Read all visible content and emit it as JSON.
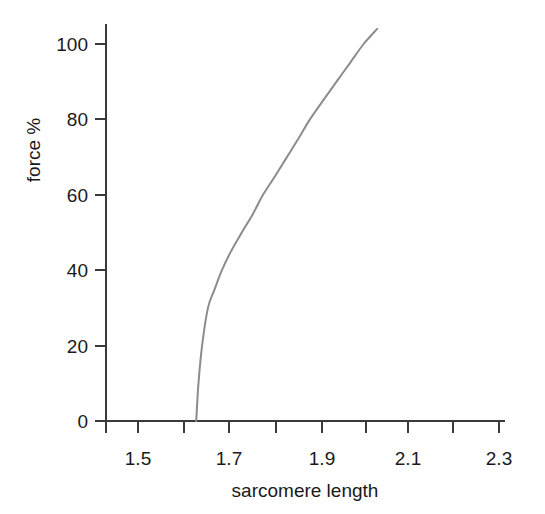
{
  "chart_data": {
    "type": "line",
    "title": "",
    "xlabel": "sarcomere length",
    "ylabel": "force %",
    "xlim": [
      1.42,
      2.3
    ],
    "ylim": [
      0,
      108
    ],
    "grid": false,
    "legend": null,
    "x_ticks": [
      {
        "value": 1.5,
        "label": "1.5",
        "major": true
      },
      {
        "value": 1.6,
        "label": "",
        "major": false
      },
      {
        "value": 1.7,
        "label": "1.7",
        "major": true
      },
      {
        "value": 1.8,
        "label": "",
        "major": false
      },
      {
        "value": 1.9,
        "label": "1.9",
        "major": true
      },
      {
        "value": 2.0,
        "label": "",
        "major": false
      },
      {
        "value": 2.1,
        "label": "2.1",
        "major": true
      },
      {
        "value": 2.2,
        "label": "",
        "major": false
      },
      {
        "value": 2.3,
        "label": "2.3",
        "major": true
      }
    ],
    "y_ticks": [
      {
        "value": 0,
        "label": "0"
      },
      {
        "value": 20,
        "label": "20"
      },
      {
        "value": 40,
        "label": "40"
      },
      {
        "value": 60,
        "label": "60"
      },
      {
        "value": 80,
        "label": "80"
      },
      {
        "value": 100,
        "label": "100"
      }
    ],
    "series": [
      {
        "name": "force",
        "color": "#8c8c8c",
        "x": [
          1.629,
          1.634,
          1.642,
          1.655,
          1.67,
          1.686,
          1.706,
          1.73,
          1.755,
          1.777,
          1.804,
          1.83,
          1.856,
          1.881,
          1.91,
          1.94,
          1.97,
          2.0,
          2.03
        ],
        "y": [
          0,
          10,
          20,
          30,
          35,
          40,
          45,
          50,
          55,
          60,
          65,
          70,
          75,
          80,
          85,
          90,
          95,
          100,
          104
        ]
      }
    ],
    "axis_color": "#3a3a3a",
    "curve_color": "#8c8c8c",
    "background": "#ffffff"
  },
  "axis_labels": {
    "x_title": "sarcomere length",
    "y_title": "force %"
  }
}
